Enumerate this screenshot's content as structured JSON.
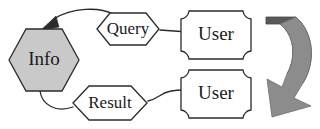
{
  "diagram": {
    "type": "flow-diagram",
    "background_color": "#ffffff",
    "line_color": "#2b2b2b",
    "nodes": [
      {
        "id": "info",
        "label": "Info",
        "shape": "hexagon",
        "fill_color": "#c9c9c9",
        "stroke_color": "#2b2b2b",
        "x": 44,
        "y": 60
      },
      {
        "id": "query",
        "label": "Query",
        "shape": "hexagon",
        "fill_color": "#ffffff",
        "stroke_color": "#2b2b2b",
        "x": 128,
        "y": 29
      },
      {
        "id": "result",
        "label": "Result",
        "shape": "hexagon",
        "fill_color": "#ffffff",
        "stroke_color": "#2b2b2b",
        "x": 110,
        "y": 103
      },
      {
        "id": "user-top",
        "label": "User",
        "shape": "concave-corner-box",
        "fill_color": "#ffffff",
        "stroke_color": "#2b2b2b",
        "x": 219,
        "y": 35
      },
      {
        "id": "user-bottom",
        "label": "User",
        "shape": "concave-corner-box",
        "fill_color": "#ffffff",
        "stroke_color": "#2b2b2b",
        "x": 219,
        "y": 94
      }
    ],
    "edges": [
      {
        "id": "user-top-to-query",
        "from": "user-top",
        "to": "query",
        "style": "plain-line",
        "arrow": "none"
      },
      {
        "id": "query-to-info",
        "from": "query",
        "to": "info",
        "style": "curved",
        "arrow": "filled-head"
      },
      {
        "id": "info-to-result",
        "from": "info",
        "to": "result",
        "style": "curved",
        "arrow": "none"
      },
      {
        "id": "result-to-user-bottom",
        "from": "result",
        "to": "user-bottom",
        "style": "curved",
        "arrow": "filled-head"
      }
    ],
    "loop_arrow": {
      "id": "user-loop-arrow",
      "label": "",
      "shape": "curved-block-arrow",
      "direction": "down-left",
      "body_color": "#595959",
      "head_color": "#8c8c8c"
    }
  }
}
